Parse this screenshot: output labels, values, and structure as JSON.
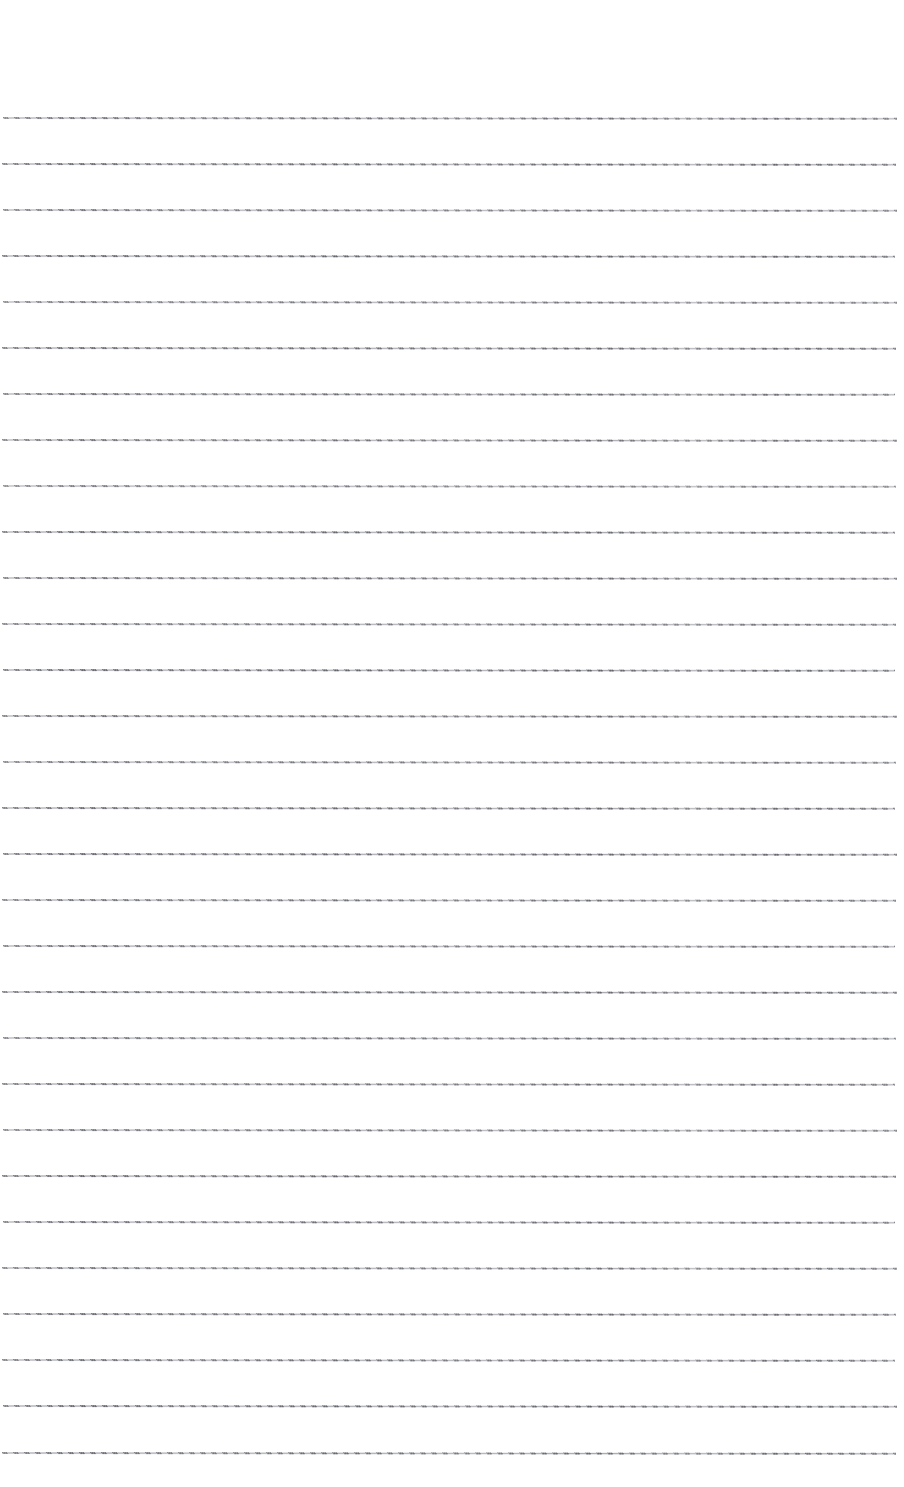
{
  "document": {
    "kind": "blank-ruled-page",
    "page_background_color": "#ffffff",
    "rule_color": "#8a8c92",
    "page_width_px": 904,
    "page_height_px": 1487,
    "visible_text": "",
    "notes_label": ""
  },
  "layout": {
    "top_margin_px": 117,
    "left_margin_px": 3,
    "right_margin_px": 9,
    "line_spacing_px": 46,
    "rule_thickness_px": 2,
    "rule_count": 30,
    "skew_degrees": 0.055
  },
  "rules": [
    {
      "index": 1,
      "y": 117,
      "left": 3,
      "right": 897,
      "opacity": 0.86
    },
    {
      "index": 2,
      "y": 163,
      "left": 2,
      "right": 896,
      "opacity": 0.9
    },
    {
      "index": 3,
      "y": 209,
      "left": 3,
      "right": 897,
      "opacity": 0.84
    },
    {
      "index": 4,
      "y": 255,
      "left": 2,
      "right": 895,
      "opacity": 0.92
    },
    {
      "index": 5,
      "y": 301,
      "left": 3,
      "right": 897,
      "opacity": 0.82
    },
    {
      "index": 6,
      "y": 347,
      "left": 2,
      "right": 896,
      "opacity": 0.9
    },
    {
      "index": 7,
      "y": 393,
      "left": 3,
      "right": 895,
      "opacity": 0.88
    },
    {
      "index": 8,
      "y": 439,
      "left": 2,
      "right": 897,
      "opacity": 0.86
    },
    {
      "index": 9,
      "y": 485,
      "left": 3,
      "right": 896,
      "opacity": 0.8
    },
    {
      "index": 10,
      "y": 531,
      "left": 2,
      "right": 895,
      "opacity": 0.9
    },
    {
      "index": 11,
      "y": 577,
      "left": 3,
      "right": 897,
      "opacity": 0.88
    },
    {
      "index": 12,
      "y": 623,
      "left": 2,
      "right": 896,
      "opacity": 0.86
    },
    {
      "index": 13,
      "y": 669,
      "left": 3,
      "right": 895,
      "opacity": 0.92
    },
    {
      "index": 14,
      "y": 715,
      "left": 2,
      "right": 897,
      "opacity": 0.88
    },
    {
      "index": 15,
      "y": 761,
      "left": 3,
      "right": 896,
      "opacity": 0.84
    },
    {
      "index": 16,
      "y": 807,
      "left": 2,
      "right": 895,
      "opacity": 0.9
    },
    {
      "index": 17,
      "y": 853,
      "left": 3,
      "right": 897,
      "opacity": 0.92
    },
    {
      "index": 18,
      "y": 899,
      "left": 2,
      "right": 896,
      "opacity": 0.86
    },
    {
      "index": 19,
      "y": 945,
      "left": 3,
      "right": 895,
      "opacity": 0.88
    },
    {
      "index": 20,
      "y": 991,
      "left": 2,
      "right": 897,
      "opacity": 0.9
    },
    {
      "index": 21,
      "y": 1037,
      "left": 3,
      "right": 896,
      "opacity": 0.86
    },
    {
      "index": 22,
      "y": 1083,
      "left": 2,
      "right": 895,
      "opacity": 0.88
    },
    {
      "index": 23,
      "y": 1129,
      "left": 3,
      "right": 897,
      "opacity": 0.84
    },
    {
      "index": 24,
      "y": 1175,
      "left": 2,
      "right": 896,
      "opacity": 0.92
    },
    {
      "index": 25,
      "y": 1221,
      "left": 3,
      "right": 895,
      "opacity": 0.88
    },
    {
      "index": 26,
      "y": 1267,
      "left": 2,
      "right": 897,
      "opacity": 0.86
    },
    {
      "index": 27,
      "y": 1313,
      "left": 3,
      "right": 896,
      "opacity": 0.9
    },
    {
      "index": 28,
      "y": 1359,
      "left": 2,
      "right": 895,
      "opacity": 0.88
    },
    {
      "index": 29,
      "y": 1405,
      "left": 3,
      "right": 897,
      "opacity": 0.92
    },
    {
      "index": 30,
      "y": 1452,
      "left": 2,
      "right": 896,
      "opacity": 0.9
    }
  ]
}
